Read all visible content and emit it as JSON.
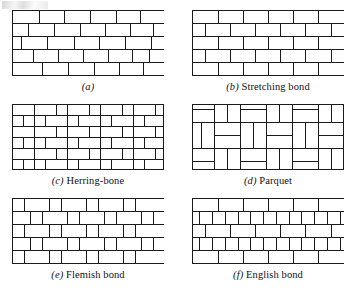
{
  "figure": {
    "title_visible": false,
    "background_color": "#ffffff",
    "stroke_color": "#1a1a1a",
    "brick_fill": "#ffffff",
    "width": 358,
    "height": 296
  },
  "panels": [
    {
      "id": "panel-a",
      "label": "(a)",
      "label_letter": "a",
      "caption_name": "",
      "caption_full": "(a)",
      "pattern_type": "running-bond-irregular",
      "x": 12,
      "y": 10,
      "w": 152,
      "h": 66,
      "rows": 5,
      "description": "Running bond with irregular stagger"
    },
    {
      "id": "panel-b",
      "label": "(b)",
      "label_letter": "b",
      "caption_name": "Stretching bond",
      "caption_full": "(b) Stretching bond",
      "pattern_type": "stretching-bond",
      "x": 192,
      "y": 10,
      "w": 152,
      "h": 66,
      "rows": 5,
      "description": "Half-lap running bond of stretchers"
    },
    {
      "id": "panel-c",
      "label": "(c)",
      "label_letter": "c",
      "caption_name": "Herring-bone",
      "caption_full": "(c) Herring-bone",
      "pattern_type": "herringbone",
      "x": 12,
      "y": 104,
      "w": 152,
      "h": 66,
      "description": "Interlocking L-shaped herringbone weave"
    },
    {
      "id": "panel-d",
      "label": "(d)",
      "label_letter": "d",
      "caption_name": "Parquet",
      "caption_full": "(d) Parquet",
      "pattern_type": "parquet",
      "x": 192,
      "y": 104,
      "w": 152,
      "h": 66,
      "description": "Basket-weave blocks of parallel bricks rotated 90 degrees"
    },
    {
      "id": "panel-e",
      "label": "(e)",
      "label_letter": "e",
      "caption_name": "Flemish bond",
      "caption_full": "(e) Flemish bond",
      "pattern_type": "flemish-bond",
      "x": 12,
      "y": 198,
      "w": 152,
      "h": 66,
      "rows": 5,
      "description": "Alternating headers and stretchers in every course"
    },
    {
      "id": "panel-f",
      "label": "(f)",
      "label_letter": "f",
      "caption_name": "English bond",
      "caption_full": "(f) English bond",
      "pattern_type": "english-bond",
      "x": 192,
      "y": 198,
      "w": 152,
      "h": 66,
      "rows": 5,
      "description": "Alternating courses of stretchers and headers"
    }
  ],
  "captions": {
    "a": {
      "letter": "(a)",
      "text": ""
    },
    "b": {
      "letter": "(b)",
      "text": "Stretching bond"
    },
    "c": {
      "letter": "(c)",
      "text": "Herring-bone"
    },
    "d": {
      "letter": "(d)",
      "text": "Parquet"
    },
    "e": {
      "letter": "(e)",
      "text": "Flemish bond"
    },
    "f": {
      "letter": "(f)",
      "text": "English bond"
    }
  }
}
